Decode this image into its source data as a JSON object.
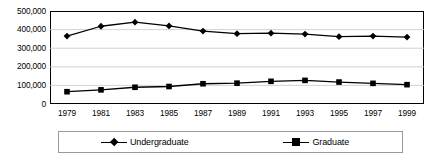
{
  "chart_data": {
    "type": "line",
    "title": "",
    "xlabel": "",
    "ylabel": "",
    "categories": [
      "1979",
      "1981",
      "1983",
      "1985",
      "1987",
      "1989",
      "1991",
      "1993",
      "1995",
      "1997",
      "1999"
    ],
    "series": [
      {
        "name": "Undergraduate",
        "marker": "diamond",
        "color": "#000000",
        "values": [
          365000,
          418000,
          440000,
          420000,
          392000,
          378000,
          381000,
          376000,
          362000,
          365000,
          360000
        ]
      },
      {
        "name": "Graduate",
        "marker": "square",
        "color": "#000000",
        "values": [
          66000,
          76000,
          90000,
          94000,
          109000,
          112000,
          122000,
          127000,
          118000,
          111000,
          104000
        ]
      }
    ],
    "ylim": [
      0,
      500000
    ],
    "ytick_labels": [
      "500,000",
      "400,000",
      "300,000",
      "200,000",
      "100,000",
      "0"
    ],
    "ytick_values": [
      500000,
      400000,
      300000,
      200000,
      100000,
      0
    ],
    "grid": true,
    "grid_axis": "y",
    "legend_position": "bottom",
    "legend_entries": [
      "Undergraduate",
      "Graduate"
    ]
  }
}
